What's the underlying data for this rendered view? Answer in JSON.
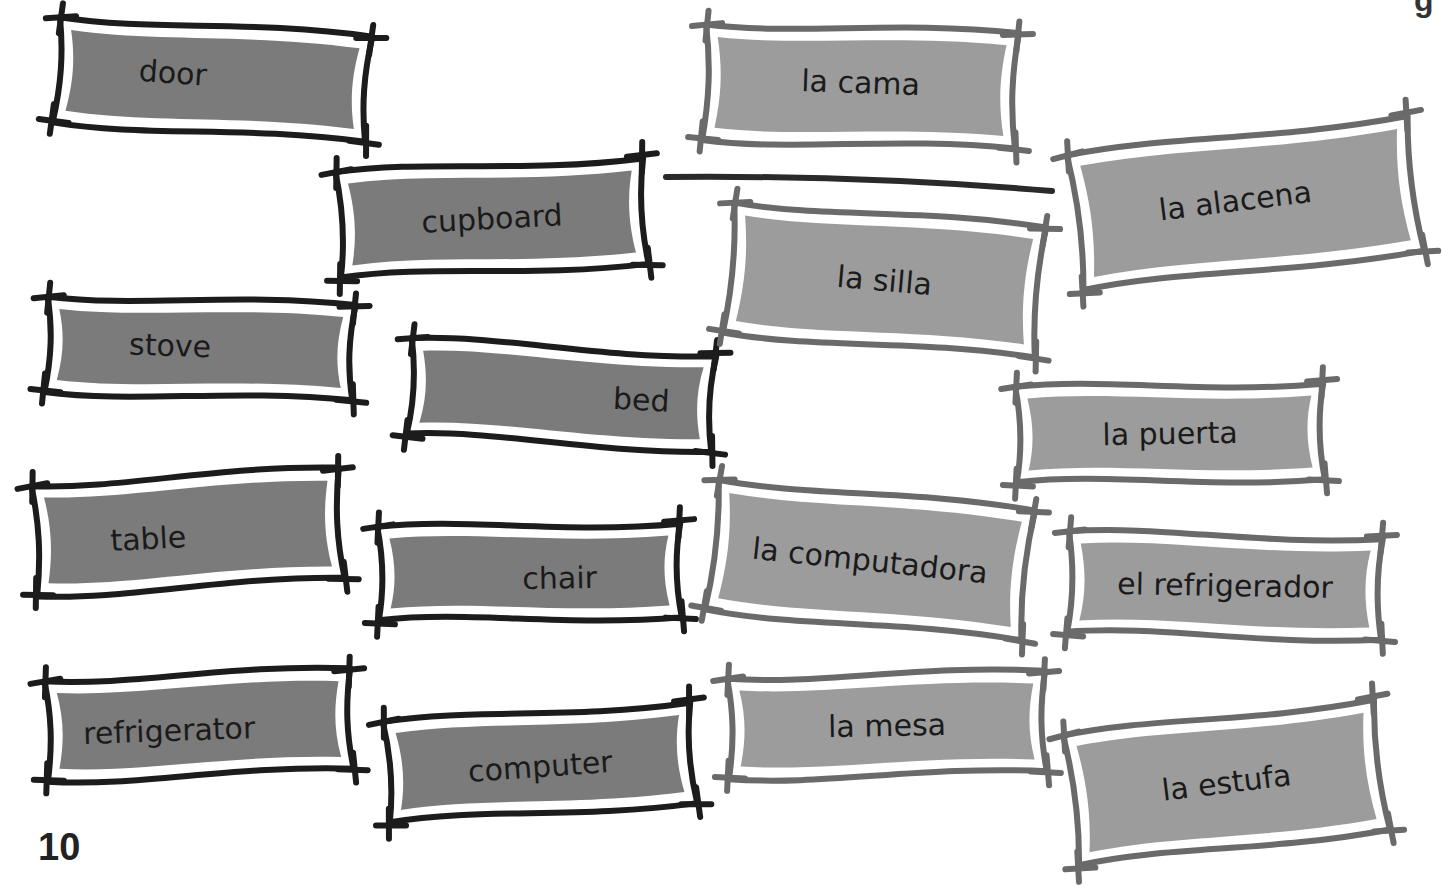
{
  "page": {
    "number": "10",
    "header_fragment": "g"
  },
  "colors": {
    "english_fill": "#7b7b7b",
    "english_frame": "#1c1c1c",
    "spanish_fill": "#9c9c9c",
    "spanish_frame": "#6a6a6a",
    "link_line": "#2a2a2a",
    "text": "#1a1a1a"
  },
  "english_cards": [
    {
      "id": "door",
      "label": "door",
      "x": 40,
      "y": 12,
      "w": 345,
      "h": 135,
      "rot": 4,
      "tx": -40,
      "ty": -4
    },
    {
      "id": "cupboard",
      "label": "cupboard",
      "x": 322,
      "y": 148,
      "w": 340,
      "h": 140,
      "rot": -3,
      "tx": 0,
      "ty": 0
    },
    {
      "id": "stove",
      "label": "stove",
      "x": 30,
      "y": 286,
      "w": 340,
      "h": 125,
      "rot": 2,
      "tx": -30,
      "ty": -2
    },
    {
      "id": "bed",
      "label": "bed",
      "x": 393,
      "y": 330,
      "w": 337,
      "h": 130,
      "rot": 3,
      "tx": 80,
      "ty": 0
    },
    {
      "id": "table",
      "label": "table",
      "x": 18,
      "y": 462,
      "w": 340,
      "h": 140,
      "rot": -3,
      "tx": -40,
      "ty": 4
    },
    {
      "id": "chair",
      "label": "chair",
      "x": 362,
      "y": 508,
      "w": 335,
      "h": 128,
      "rot": -1,
      "tx": 30,
      "ty": 6
    },
    {
      "id": "refrigerator",
      "label": "refrigerator",
      "x": 30,
      "y": 660,
      "w": 338,
      "h": 130,
      "rot": -2,
      "tx": -30,
      "ty": 4
    },
    {
      "id": "computer",
      "label": "computer",
      "x": 370,
      "y": 695,
      "w": 340,
      "h": 135,
      "rot": -4,
      "tx": 0,
      "ty": 4
    }
  ],
  "spanish_cards": [
    {
      "id": "la-cama",
      "label": "la cama",
      "x": 688,
      "y": 14,
      "w": 345,
      "h": 145,
      "rot": 2,
      "tx": 0,
      "ty": -4
    },
    {
      "id": "la-alacena",
      "label": "la alacena",
      "x": 1058,
      "y": 118,
      "w": 375,
      "h": 170,
      "rot": -7,
      "tx": -10,
      "ty": -4
    },
    {
      "id": "la-silla",
      "label": "la silla",
      "x": 712,
      "y": 200,
      "w": 345,
      "h": 160,
      "rot": 5,
      "tx": 0,
      "ty": 0
    },
    {
      "id": "la-puerta",
      "label": "la puerta",
      "x": 1000,
      "y": 368,
      "w": 340,
      "h": 130,
      "rot": -1,
      "tx": 0,
      "ty": 0
    },
    {
      "id": "la-computadora",
      "label": "la computadora",
      "x": 695,
      "y": 480,
      "w": 350,
      "h": 160,
      "rot": 6,
      "tx": 0,
      "ty": 0
    },
    {
      "id": "el-refrigerador",
      "label": "el refrigerador",
      "x": 1052,
      "y": 518,
      "w": 346,
      "h": 135,
      "rot": 1,
      "tx": 0,
      "ty": 0
    },
    {
      "id": "la-mesa",
      "label": "la mesa",
      "x": 712,
      "y": 660,
      "w": 350,
      "h": 130,
      "rot": -1,
      "tx": 0,
      "ty": 0
    },
    {
      "id": "la-estufa",
      "label": "la estufa",
      "x": 1054,
      "y": 700,
      "w": 345,
      "h": 165,
      "rot": -7,
      "tx": 0,
      "ty": 0
    }
  ],
  "links": [
    {
      "from": "cupboard",
      "to": "la-alacena",
      "x1": 666,
      "y1": 177,
      "x2": 1052,
      "y2": 191
    }
  ]
}
